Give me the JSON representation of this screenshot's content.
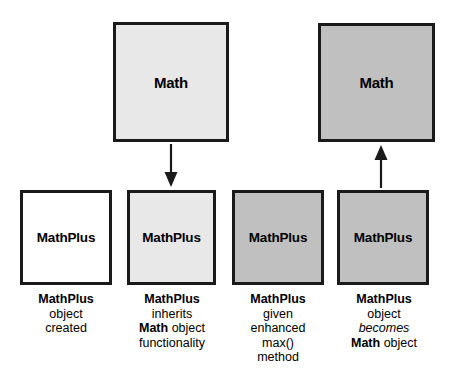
{
  "diagram": {
    "colors": {
      "border": "#1a1a1a",
      "white_fill": "#ffffff",
      "light_gray_fill": "#e8e8e8",
      "dark_gray_fill": "#c0c0c0",
      "text": "#000000",
      "background": "#ffffff"
    },
    "top_row": [
      {
        "id": "math-box-1",
        "label": "Math",
        "fill": "light-gray"
      },
      {
        "id": "math-box-2",
        "label": "Math",
        "fill": "dark-gray"
      }
    ],
    "bottom_row": [
      {
        "id": "mathplus-box-1",
        "label": "MathPlus",
        "fill": "white"
      },
      {
        "id": "mathplus-box-2",
        "label": "MathPlus",
        "fill": "light-gray"
      },
      {
        "id": "mathplus-box-3",
        "label": "MathPlus",
        "fill": "dark-gray"
      },
      {
        "id": "mathplus-box-4",
        "label": "MathPlus",
        "fill": "dark-gray"
      }
    ],
    "arrows": [
      {
        "id": "arrow-down",
        "direction": "down",
        "from": "math-box-1",
        "to": "mathplus-box-2"
      },
      {
        "id": "arrow-up",
        "direction": "up",
        "from": "mathplus-box-4",
        "to": "math-box-2"
      }
    ],
    "captions": [
      {
        "id": "caption-1",
        "lines": [
          {
            "text": "MathPlus",
            "style": "bold"
          },
          {
            "text": "object",
            "style": "normal"
          },
          {
            "text": "created",
            "style": "normal"
          }
        ]
      },
      {
        "id": "caption-2",
        "lines": [
          {
            "text": "MathPlus",
            "style": "bold"
          },
          {
            "text": "inherits",
            "style": "normal"
          },
          {
            "text": "Math object",
            "style": "mixed",
            "bold_prefix": "Math",
            "normal_suffix": " object"
          },
          {
            "text": "functionality",
            "style": "normal"
          }
        ]
      },
      {
        "id": "caption-3",
        "lines": [
          {
            "text": "MathPlus",
            "style": "bold"
          },
          {
            "text": "given",
            "style": "normal"
          },
          {
            "text": "enhanced",
            "style": "normal"
          },
          {
            "text": "max()",
            "style": "normal"
          },
          {
            "text": "method",
            "style": "normal"
          }
        ]
      },
      {
        "id": "caption-4",
        "lines": [
          {
            "text": "MathPlus",
            "style": "bold"
          },
          {
            "text": "object",
            "style": "normal"
          },
          {
            "text": "becomes",
            "style": "italic"
          },
          {
            "text": "Math object",
            "style": "mixed",
            "bold_prefix": "Math",
            "normal_suffix": " object"
          }
        ]
      }
    ]
  }
}
